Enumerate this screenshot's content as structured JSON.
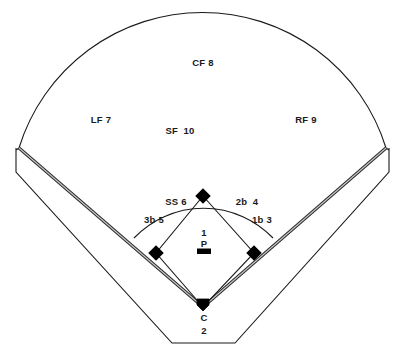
{
  "diagram": {
    "type": "baseball-field-diagram",
    "colors": {
      "line": "#1a1a1a",
      "foul_line": "#777777",
      "base": "#000000",
      "background": "#ffffff",
      "text": "#1a1a1a"
    },
    "positions": [
      {
        "key": "center_field",
        "label": "CF 8",
        "abbr": "CF",
        "number": "8",
        "x": 203,
        "y": 62
      },
      {
        "key": "left_field",
        "label": "LF 7",
        "abbr": "LF",
        "number": "7",
        "x": 101,
        "y": 119
      },
      {
        "key": "right_field",
        "label": "RF 9",
        "abbr": "RF",
        "number": "9",
        "x": 306,
        "y": 119
      },
      {
        "key": "short_field",
        "label": "SF  10",
        "abbr": "SF",
        "number": "10",
        "x": 180,
        "y": 130
      },
      {
        "key": "shortstop",
        "label": "SS 6",
        "abbr": "SS",
        "number": "6",
        "x": 176,
        "y": 201
      },
      {
        "key": "second_base",
        "label": "2b  4",
        "abbr": "2b",
        "number": "4",
        "x": 247,
        "y": 201
      },
      {
        "key": "third_base",
        "label": "3b 5",
        "abbr": "3b",
        "number": "5",
        "x": 154,
        "y": 219
      },
      {
        "key": "first_base",
        "label": "1b 3",
        "abbr": "1b",
        "number": "3",
        "x": 262,
        "y": 219
      }
    ],
    "pitcher": {
      "number": "1",
      "label": "P",
      "x": 204,
      "y": 234
    },
    "catcher": {
      "label": "C",
      "number": "2",
      "x": 204,
      "y": 317
    }
  }
}
